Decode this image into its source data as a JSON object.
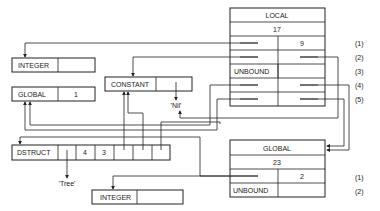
{
  "local_frame": {
    "header": "LOCAL",
    "size": "17",
    "rows": [
      {
        "index": "(1)",
        "left": "",
        "right": "9"
      },
      {
        "index": "(2)",
        "left": "",
        "right": ""
      },
      {
        "index": "(3)",
        "left": "UNBOUND",
        "right": ""
      },
      {
        "index": "(4)",
        "left": "",
        "right": ""
      },
      {
        "index": "(5)",
        "left": "",
        "right": ""
      }
    ]
  },
  "global_frame": {
    "header": "GLOBAL",
    "size": "23",
    "rows": [
      {
        "index": "(1)",
        "left": "",
        "right": "2"
      },
      {
        "index": "(2)",
        "left": "UNBOUND",
        "right": ""
      }
    ]
  },
  "integer_top": {
    "tag": "INTEGER",
    "value": ""
  },
  "global_cell": {
    "tag": "GLOBAL",
    "value": "1"
  },
  "constant_cell": {
    "tag": "CONSTANT",
    "value": ""
  },
  "nil_label": "'Nil'",
  "dstruct": {
    "tag": "DSTRUCT",
    "cells": [
      "",
      "4",
      "3",
      "",
      "",
      ""
    ]
  },
  "tree_label": "'Tree'",
  "integer_bottom": {
    "tag": "INTEGER",
    "value": ""
  }
}
